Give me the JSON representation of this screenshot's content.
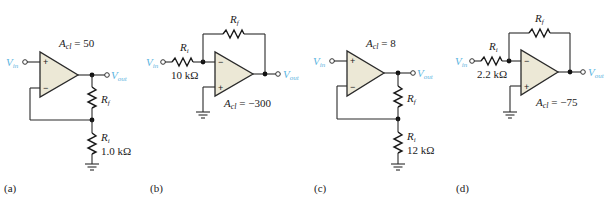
{
  "figure": {
    "colors": {
      "wire": "#2a2a2a",
      "opamp_fill": "#ece8d6",
      "signal_label": "#5bb4e0"
    },
    "circuits": [
      {
        "panel": "(a)",
        "type": "noninverting",
        "gain_label": "A",
        "gain_sub": "cl",
        "gain_value": " = 50",
        "vin_label": "V",
        "vin_sub": "in",
        "vout_label": "V",
        "vout_sub": "out",
        "rf_label": "R",
        "rf_sub": "f",
        "ri_label": "R",
        "ri_sub": "i",
        "ri_value": "1.0 kΩ",
        "plus": "+",
        "minus": "−"
      },
      {
        "panel": "(b)",
        "type": "inverting",
        "gain_label": "A",
        "gain_sub": "cl",
        "gain_value": " = −300",
        "vin_label": "V",
        "vin_sub": "in",
        "vout_label": "V",
        "vout_sub": "out",
        "rf_label": "R",
        "rf_sub": "f",
        "ri_label": "R",
        "ri_sub": "i",
        "ri_value": "10 kΩ",
        "plus": "+",
        "minus": "−"
      },
      {
        "panel": "(c)",
        "type": "noninverting",
        "gain_label": "A",
        "gain_sub": "cl",
        "gain_value": " = 8",
        "vin_label": "V",
        "vin_sub": "in",
        "vout_label": "V",
        "vout_sub": "out",
        "rf_label": "R",
        "rf_sub": "f",
        "ri_label": "R",
        "ri_sub": "i",
        "ri_value": "12 kΩ",
        "plus": "+",
        "minus": "−"
      },
      {
        "panel": "(d)",
        "type": "inverting",
        "gain_label": "A",
        "gain_sub": "cl",
        "gain_value": " = −75",
        "vin_label": "V",
        "vin_sub": "in",
        "vout_label": "V",
        "vout_sub": "out",
        "rf_label": "R",
        "rf_sub": "f",
        "ri_label": "R",
        "ri_sub": "i",
        "ri_value": "2.2 kΩ",
        "plus": "+",
        "minus": "−"
      }
    ]
  }
}
